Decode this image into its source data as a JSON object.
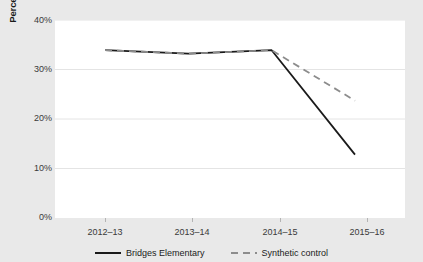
{
  "chart_data": {
    "type": "line",
    "title": "",
    "xlabel": "",
    "ylabel": "Percentage students chronically absent",
    "categories": [
      "2012–13",
      "2013–14",
      "2014–15",
      "2015–16"
    ],
    "ylim": [
      0,
      40
    ],
    "ytick_labels": [
      "0%",
      "10%",
      "20%",
      "30%",
      "40%"
    ],
    "ytick_values": [
      0,
      10,
      20,
      30,
      40
    ],
    "grid": "horizontal",
    "legend_position": "bottom",
    "series": [
      {
        "name": "Bridges Elementary",
        "style": "solid",
        "color": "#1a1a1a",
        "values": [
          33.9,
          33.2,
          33.9,
          12.8
        ]
      },
      {
        "name": "Synthetic control",
        "style": "dashed",
        "color": "#8c8c8c",
        "values": [
          33.9,
          33.2,
          33.9,
          23.7
        ]
      }
    ]
  },
  "colors": {
    "figure_background": "#e9e9e9",
    "plot_background": "#ffffff",
    "gridline": "#e4e4e4",
    "tick_text": "#3a3a3a",
    "axis_title": "#1a1a1a"
  }
}
